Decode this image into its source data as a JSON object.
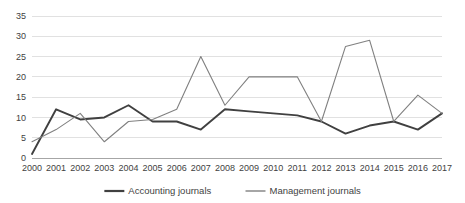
{
  "chart_data": {
    "type": "line",
    "title": "",
    "xlabel": "",
    "ylabel": "",
    "categories": [
      "2000",
      "2001",
      "2002",
      "2003",
      "2004",
      "2005",
      "2006",
      "2007",
      "2008",
      "2009",
      "2010",
      "2011",
      "2012",
      "2013",
      "2014",
      "2015",
      "2016",
      "2017"
    ],
    "series": [
      {
        "name": "Accounting journals",
        "color": "#404040",
        "width": 1.9,
        "values": [
          1,
          12,
          9.5,
          10,
          13,
          9,
          9,
          7,
          12,
          11.5,
          11,
          10.5,
          9,
          6,
          8,
          9,
          7,
          11
        ]
      },
      {
        "name": "Management journals",
        "color": "#808080",
        "width": 1.1,
        "values": [
          4,
          7,
          11,
          4,
          9,
          9.5,
          12,
          25,
          13,
          20,
          20,
          20,
          9,
          27.5,
          29,
          9,
          15.5,
          11
        ]
      }
    ],
    "ylim": [
      0,
      35
    ],
    "yticks": [
      0,
      5,
      10,
      15,
      20,
      25,
      30,
      35
    ],
    "ytick_labels": [
      "0",
      "5",
      "10",
      "15",
      "20",
      "25",
      "30",
      "35"
    ],
    "grid": true,
    "grid_axis": "y",
    "grid_color": "#d9d9d9",
    "axis_color": "#a6a6a6",
    "legend_position": "bottom",
    "legend": [
      {
        "label": "Accounting journals",
        "color": "#404040",
        "width": 1.9
      },
      {
        "label": "Management journals",
        "color": "#808080",
        "width": 1.1
      }
    ],
    "background": "#ffffff"
  }
}
